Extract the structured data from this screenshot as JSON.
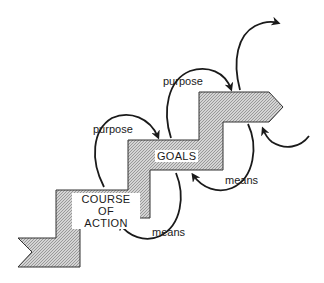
{
  "diagram": {
    "type": "staircase-flow",
    "steps": [
      {
        "id": "course-of-action",
        "label_lines": [
          "COURSE OF",
          "ACTION"
        ]
      },
      {
        "id": "goals",
        "label": "GOALS"
      },
      {
        "id": "next-level",
        "label": ""
      }
    ],
    "arrows": [
      {
        "label": "purpose",
        "from": "course-of-action",
        "to": "goals"
      },
      {
        "label": "purpose",
        "from": "goals",
        "to": "next-level"
      },
      {
        "label": "means",
        "from": "goals",
        "to": "course-of-action"
      },
      {
        "label": "means",
        "from": "next-level",
        "to": "goals"
      }
    ],
    "colors": {
      "fill": "#bdbdbd",
      "outline": "#333333",
      "arrow": "#1a1a1a",
      "background": "#ffffff"
    }
  },
  "labels": {
    "course_line1": "COURSE OF",
    "course_line2": "ACTION",
    "goals": "GOALS",
    "purpose_lower": "purpose",
    "purpose_upper": "purpose",
    "means_lower": "means",
    "means_upper": "means"
  }
}
